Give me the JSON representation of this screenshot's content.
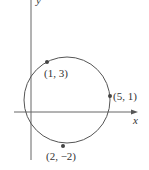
{
  "figure": {
    "type": "circle-on-coordinate-plane",
    "axes": {
      "x_label": "x",
      "y_label": "y"
    },
    "points": [
      {
        "label": "(1, 3)",
        "x": 1,
        "y": 3
      },
      {
        "label": "(5, 1)",
        "x": 5,
        "y": 1
      },
      {
        "label": "(2, −2)",
        "x": 2,
        "y": -2
      }
    ],
    "colors": {
      "stroke": "#555555",
      "point": "#444444"
    }
  }
}
